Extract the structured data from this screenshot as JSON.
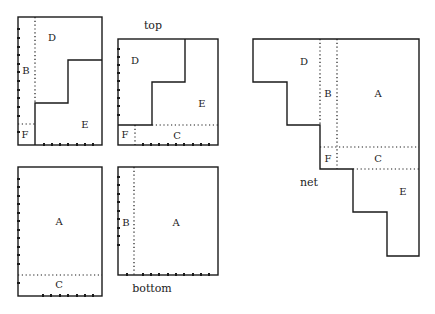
{
  "captions": {
    "top": "top",
    "bottom": "bottom",
    "net": "net"
  },
  "panels": [
    {
      "name": "panel-top-left",
      "labels": {
        "D": "D",
        "B": "B",
        "F": "F",
        "E": "E"
      }
    },
    {
      "name": "panel-top",
      "labels": {
        "D": "D",
        "E": "E",
        "F": "F",
        "C": "C"
      }
    },
    {
      "name": "panel-bottom-left",
      "labels": {
        "A": "A",
        "C": "C"
      }
    },
    {
      "name": "panel-bottom",
      "labels": {
        "B": "B",
        "A": "A"
      }
    },
    {
      "name": "panel-net",
      "labels": {
        "D": "D",
        "B": "B",
        "A": "A",
        "F": "F",
        "C": "C",
        "E": "E"
      }
    }
  ]
}
